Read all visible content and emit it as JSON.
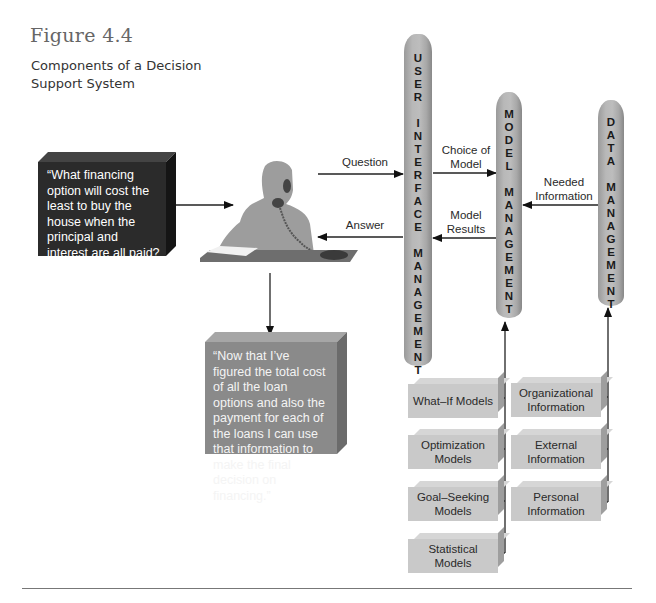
{
  "figure": {
    "number": "Figure 4.4",
    "caption": "Components of a Decision Support System"
  },
  "question_bubble": {
    "text": "“What financing option will cost the least to buy the house when the principal and interest are all paid? What option will result in the lowest monthly payments?”",
    "color": "#2b2b2b"
  },
  "answer_bubble": {
    "text": "“Now that I’ve figured the total cost of all the loan options and also the payment for each of the loans I can use that information to make the final decision on financing.”",
    "color": "#8a8a8a"
  },
  "person": {
    "icon": "person-on-phone-at-desk-icon"
  },
  "pillars": {
    "user_interface": {
      "words": [
        "USER",
        "INTERFACE",
        "MANAGEMENT"
      ]
    },
    "model": {
      "words": [
        "MODEL",
        "MANAGEMENT"
      ]
    },
    "data": {
      "words": [
        "DATA",
        "MANAGEMENT"
      ]
    }
  },
  "arrows": {
    "question": "Question",
    "answer": "Answer",
    "choice_of_model_1": "Choice of",
    "choice_of_model_2": "Model",
    "model_results_1": "Model",
    "model_results_2": "Results",
    "needed_info_1": "Needed",
    "needed_info_2": "Information"
  },
  "model_boxes": [
    {
      "line1": "What–If Models",
      "line2": ""
    },
    {
      "line1": "Optimization",
      "line2": "Models"
    },
    {
      "line1": "Goal–Seeking",
      "line2": "Models"
    },
    {
      "line1": "Statistical",
      "line2": "Models"
    }
  ],
  "data_boxes": [
    {
      "line1": "Organizational",
      "line2": "Information"
    },
    {
      "line1": "External",
      "line2": "Information"
    },
    {
      "line1": "Personal",
      "line2": "Information"
    }
  ]
}
